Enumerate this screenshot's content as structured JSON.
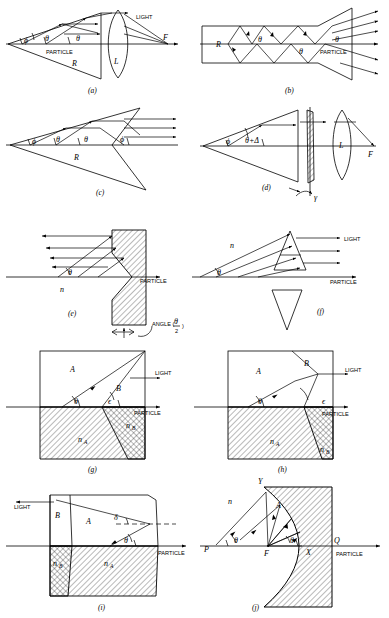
{
  "figure": {
    "width": 389,
    "height": 618,
    "background": "#ffffff",
    "ink": "#000000"
  },
  "symbols": {
    "theta": "θ",
    "phi": "ϕ",
    "epsilon": "ϵ",
    "delta_lower": "δ",
    "delta_upper": "Δ",
    "gamma": "γ",
    "theta_plus_delta": "θ+Δ",
    "n": "n",
    "n_A": "n",
    "n_B": "n",
    "sub_A": "A",
    "sub_B": "B",
    "R": "R",
    "L": "L",
    "F": "F",
    "A": "A",
    "B": "B",
    "P": "P",
    "Q": "Q",
    "X": "X",
    "Y": "Y"
  },
  "words": {
    "light": "LIGHT",
    "particle": "PARTICLE",
    "angle_label": "ANGLE (",
    "angle_close": ")",
    "angle_num": "θ",
    "angle_den": "2"
  },
  "panels": [
    {
      "id": "a",
      "caption": "(a)",
      "description": "Cone reflector R with converging lens L focusing to point F",
      "labels": [
        "ϕ",
        "θ",
        "θ",
        "PARTICLE",
        "R",
        "L",
        "LIGHT",
        "F"
      ]
    },
    {
      "id": "b",
      "caption": "(b)",
      "description": "Straight light pipe R with multiple internal reflections at angle theta, flared exit",
      "labels": [
        "R",
        "θ",
        "θ",
        "θ",
        "PARTICLE"
      ]
    },
    {
      "id": "c",
      "caption": "(c)",
      "description": "Double cone reflector R, rays exit parallel at angle phi",
      "labels": [
        "ϕ",
        "θ",
        "θ",
        "ϕ",
        "R"
      ]
    },
    {
      "id": "d",
      "caption": "(d)",
      "description": "Cone plus rotating hatched wedge (rotation gamma) plus lens L to focus F",
      "labels": [
        "ϕ",
        "θ+Δ",
        "L",
        "F",
        "γ"
      ]
    },
    {
      "id": "e",
      "caption": "(e)",
      "description": "Hatched block with concave conical front face, index n, rays retro-reflect at theta",
      "labels": [
        "θ",
        "n",
        "PARTICLE",
        "ANGLE (θ/2)"
      ]
    },
    {
      "id": "f",
      "caption": "(f)",
      "description": "Upright and inverted triangular prisms, index n, converting theta rays to LIGHT",
      "labels": [
        "n",
        "θ",
        "LIGHT",
        "PARTICLE"
      ]
    },
    {
      "id": "g",
      "caption": "(g)",
      "description": "Two-media block, region A above n_A and region B above n_B, angles theta and epsilon",
      "labels": [
        "A",
        "B",
        "θ",
        "ϵ",
        "LIGHT",
        "PARTICLE",
        "nA",
        "nB"
      ]
    },
    {
      "id": "h",
      "caption": "(h)",
      "description": "Two-media block variant with steeper B boundary, angles theta and epsilon",
      "labels": [
        "A",
        "B",
        "θ",
        "ϵ",
        "LIGHT",
        "PARTICLE",
        "nA",
        "nB"
      ]
    },
    {
      "id": "i",
      "caption": "(i)",
      "description": "Block with region B left, region A right, curved right face, deviation delta and angle theta, LIGHT exits left",
      "labels": [
        "LIGHT",
        "B",
        "A",
        "δ",
        "θ",
        "PARTICLE",
        "nB",
        "nA"
      ]
    },
    {
      "id": "j",
      "caption": "(j)",
      "description": "Parabolic hatched reflector with focus F on axis P-F-X-Q, vertex points Y and X, ray bundle A, index n",
      "labels": [
        "Y",
        "n",
        "A",
        "θ",
        "θ",
        "P",
        "F",
        "X",
        "Q",
        "PARTICLE"
      ]
    }
  ]
}
